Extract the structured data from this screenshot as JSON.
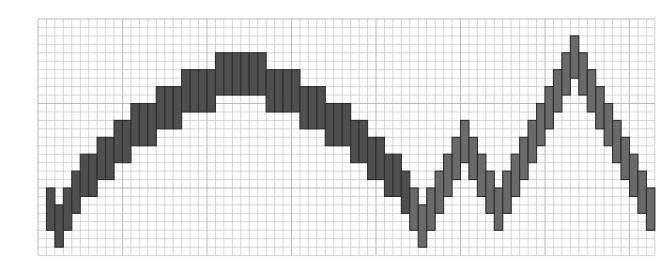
{
  "chart_data": {
    "type": "bar",
    "subtype": "floating-range-bar",
    "title": "",
    "xlabel": "",
    "ylabel": "",
    "grid": true,
    "legend": null,
    "grid_units": {
      "columns": 73,
      "rows": 28
    },
    "ylim": [
      0,
      28
    ],
    "bar_height_units": 5,
    "x": [
      1,
      2,
      3,
      4,
      5,
      6,
      7,
      8,
      9,
      10,
      11,
      12,
      13,
      14,
      15,
      16,
      17,
      18,
      19,
      20,
      21,
      22,
      23,
      24,
      25,
      26,
      27,
      28,
      29,
      30,
      31,
      32,
      33,
      34,
      35,
      36,
      37,
      38,
      39,
      40,
      41,
      42,
      43,
      44,
      45,
      46,
      47,
      48,
      49,
      50,
      51,
      52,
      53,
      54,
      55,
      56,
      57,
      58,
      59,
      60,
      61,
      62,
      63,
      64,
      65,
      66,
      67,
      68,
      69,
      70,
      71,
      72
    ],
    "high": [
      8,
      6,
      8,
      10,
      12,
      12,
      14,
      14,
      16,
      16,
      18,
      18,
      18,
      20,
      20,
      20,
      22,
      22,
      22,
      22,
      24,
      24,
      24,
      24,
      24,
      24,
      22,
      22,
      22,
      22,
      20,
      20,
      20,
      18,
      18,
      18,
      16,
      16,
      14,
      14,
      12,
      12,
      10,
      8,
      6,
      8,
      10,
      12,
      14,
      16,
      14,
      12,
      10,
      8,
      10,
      12,
      14,
      16,
      18,
      20,
      22,
      24,
      26,
      24,
      22,
      20,
      18,
      16,
      14,
      12,
      10,
      8
    ],
    "low": [
      3,
      1,
      3,
      5,
      7,
      7,
      9,
      9,
      11,
      11,
      13,
      13,
      13,
      15,
      15,
      15,
      17,
      17,
      17,
      17,
      19,
      19,
      19,
      19,
      19,
      19,
      17,
      17,
      17,
      17,
      15,
      15,
      15,
      13,
      13,
      13,
      11,
      11,
      9,
      9,
      7,
      7,
      5,
      3,
      1,
      3,
      5,
      7,
      9,
      11,
      9,
      7,
      5,
      3,
      5,
      7,
      9,
      11,
      13,
      15,
      17,
      19,
      21,
      19,
      17,
      15,
      13,
      11,
      9,
      7,
      5,
      3
    ],
    "colors": {
      "bar_fill_dark": "#4f4f4f",
      "bar_fill_light": "#6a6a6a",
      "bar_outline": "#2e2e2e",
      "grid": "#c9c9c9",
      "background": "#ffffff"
    }
  },
  "layout": {
    "origin_x": 38,
    "origin_y": 19,
    "cell": 8.45
  }
}
